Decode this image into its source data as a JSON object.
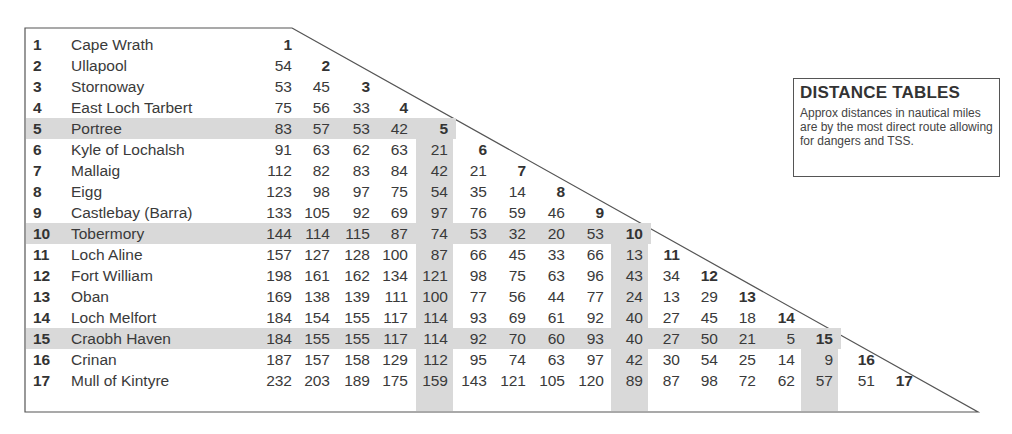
{
  "legend": {
    "title": "DISTANCE TABLES",
    "text": "Approx distances in nautical miles are by the most direct route allowing for dangers and TSS."
  },
  "highlight": {
    "rows": [
      5,
      10,
      15
    ],
    "color": "#d9d9d9"
  },
  "places": [
    {
      "num": "1",
      "name": "Cape Wrath"
    },
    {
      "num": "2",
      "name": "Ullapool"
    },
    {
      "num": "3",
      "name": "Stornoway"
    },
    {
      "num": "4",
      "name": "East Loch Tarbert"
    },
    {
      "num": "5",
      "name": "Portree"
    },
    {
      "num": "6",
      "name": "Kyle of Lochalsh"
    },
    {
      "num": "7",
      "name": "Mallaig"
    },
    {
      "num": "8",
      "name": "Eigg"
    },
    {
      "num": "9",
      "name": "Castlebay (Barra)"
    },
    {
      "num": "10",
      "name": "Tobermory"
    },
    {
      "num": "11",
      "name": "Loch Aline"
    },
    {
      "num": "12",
      "name": "Fort William"
    },
    {
      "num": "13",
      "name": "Oban"
    },
    {
      "num": "14",
      "name": "Loch Melfort"
    },
    {
      "num": "15",
      "name": "Craobh Haven"
    },
    {
      "num": "16",
      "name": "Crinan"
    },
    {
      "num": "17",
      "name": "Mull of Kintyre"
    }
  ],
  "distances": [
    [],
    [
      "54"
    ],
    [
      "53",
      "45"
    ],
    [
      "75",
      "56",
      "33"
    ],
    [
      "83",
      "57",
      "53",
      "42"
    ],
    [
      "91",
      "63",
      "62",
      "63",
      "21"
    ],
    [
      "112",
      "82",
      "83",
      "84",
      "42",
      "21"
    ],
    [
      "123",
      "98",
      "97",
      "75",
      "54",
      "35",
      "14"
    ],
    [
      "133",
      "105",
      "92",
      "69",
      "97",
      "76",
      "59",
      "46"
    ],
    [
      "144",
      "114",
      "115",
      "87",
      "74",
      "53",
      "32",
      "20",
      "53"
    ],
    [
      "157",
      "127",
      "128",
      "100",
      "87",
      "66",
      "45",
      "33",
      "66",
      "13"
    ],
    [
      "198",
      "161",
      "162",
      "134",
      "121",
      "98",
      "75",
      "63",
      "96",
      "43",
      "34"
    ],
    [
      "169",
      "138",
      "139",
      "111",
      "100",
      "77",
      "56",
      "44",
      "77",
      "24",
      "13",
      "29"
    ],
    [
      "184",
      "154",
      "155",
      "117",
      "114",
      "93",
      "69",
      "61",
      "92",
      "40",
      "27",
      "45",
      "18"
    ],
    [
      "184",
      "155",
      "155",
      "117",
      "114",
      "92",
      "70",
      "60",
      "93",
      "40",
      "27",
      "50",
      "21",
      "5"
    ],
    [
      "187",
      "157",
      "158",
      "129",
      "112",
      "95",
      "74",
      "63",
      "97",
      "42",
      "30",
      "54",
      "25",
      "14",
      "9"
    ],
    [
      "232",
      "203",
      "189",
      "175",
      "159",
      "143",
      "121",
      "105",
      "120",
      "89",
      "87",
      "98",
      "72",
      "62",
      "57",
      "51"
    ]
  ]
}
